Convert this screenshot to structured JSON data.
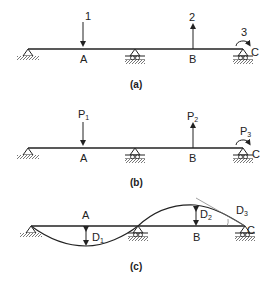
{
  "figure": {
    "panels": [
      {
        "id": "a",
        "caption": "(a)",
        "points": {
          "A": "A",
          "B": "B",
          "C": "C"
        },
        "loads": {
          "load1": "1",
          "load2": "2",
          "load3": "3"
        }
      },
      {
        "id": "b",
        "caption": "(b)",
        "points": {
          "A": "A",
          "B": "B",
          "C": "C"
        },
        "loads": {
          "load1": "P",
          "load1_sub": "1",
          "load2": "P",
          "load2_sub": "2",
          "load3": "P",
          "load3_sub": "3"
        }
      },
      {
        "id": "c",
        "caption": "(c)",
        "points": {
          "A": "A",
          "B": "B",
          "C": "C"
        },
        "deflections": {
          "d1": "D",
          "d1_sub": "1",
          "d2": "D",
          "d2_sub": "2",
          "d3": "D",
          "d3_sub": "3"
        }
      }
    ],
    "colors": {
      "ink": "#222222",
      "hatch": "#555555"
    }
  }
}
